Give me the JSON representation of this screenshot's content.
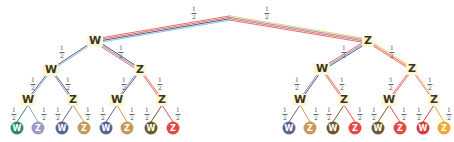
{
  "diagram": {
    "type": "probability-tree",
    "depth": 4,
    "colors": {
      "blue": "#8fc1e3",
      "navy": "#4a5a8c",
      "red": "#e8706a",
      "yellow": "#f2d27a",
      "slate": "#8a98b8",
      "node_bg": "#fdf7d8"
    },
    "nodes": [
      {
        "id": "n1",
        "label": "W",
        "x": 95,
        "y": 41
      },
      {
        "id": "n2",
        "label": "Z",
        "x": 368,
        "y": 41
      },
      {
        "id": "n11",
        "label": "W",
        "x": 51,
        "y": 70
      },
      {
        "id": "n12",
        "label": "Z",
        "x": 140,
        "y": 70
      },
      {
        "id": "n21",
        "label": "W",
        "x": 322,
        "y": 69
      },
      {
        "id": "n22",
        "label": "Z",
        "x": 412,
        "y": 69
      },
      {
        "id": "n111",
        "label": "W",
        "x": 28,
        "y": 100
      },
      {
        "id": "n112",
        "label": "Z",
        "x": 73,
        "y": 100
      },
      {
        "id": "n121",
        "label": "W",
        "x": 117,
        "y": 100
      },
      {
        "id": "n122",
        "label": "Z",
        "x": 162,
        "y": 100
      },
      {
        "id": "n211",
        "label": "W",
        "x": 300,
        "y": 100
      },
      {
        "id": "n212",
        "label": "Z",
        "x": 344,
        "y": 100
      },
      {
        "id": "n221",
        "label": "W",
        "x": 389,
        "y": 100
      },
      {
        "id": "n222",
        "label": "Z",
        "x": 434,
        "y": 100
      }
    ],
    "leaves": [
      {
        "label": "W",
        "x": 17,
        "color": "#2e8a76"
      },
      {
        "label": "Z",
        "x": 38,
        "color": "#9a9cc8"
      },
      {
        "label": "W",
        "x": 62,
        "color": "#5c6494"
      },
      {
        "label": "Z",
        "x": 84,
        "color": "#c89a5a"
      },
      {
        "label": "W",
        "x": 106,
        "color": "#5c6494"
      },
      {
        "label": "Z",
        "x": 127,
        "color": "#c89a5a"
      },
      {
        "label": "W",
        "x": 151,
        "color": "#6e5a2a"
      },
      {
        "label": "Z",
        "x": 173,
        "color": "#e24a46"
      },
      {
        "label": "W",
        "x": 289,
        "color": "#5c6494"
      },
      {
        "label": "Z",
        "x": 310,
        "color": "#c89a5a"
      },
      {
        "label": "W",
        "x": 333,
        "color": "#6e5a2a"
      },
      {
        "label": "Z",
        "x": 355,
        "color": "#e24a46"
      },
      {
        "label": "W",
        "x": 378,
        "color": "#6e5a2a"
      },
      {
        "label": "Z",
        "x": 400,
        "color": "#e24a46"
      },
      {
        "label": "W",
        "x": 423,
        "color": "#d83c3c"
      },
      {
        "label": "Z",
        "x": 444,
        "color": "#f0a830"
      }
    ],
    "leaf_y": 128,
    "root": {
      "x": 230,
      "y": 18
    },
    "edge_probability": {
      "num": "1",
      "den": "2"
    },
    "probabilities": [
      {
        "x": 194,
        "y": 13
      },
      {
        "x": 267,
        "y": 13
      },
      {
        "x": 62,
        "y": 52
      },
      {
        "x": 121,
        "y": 52
      },
      {
        "x": 344,
        "y": 52
      },
      {
        "x": 392,
        "y": 52
      },
      {
        "x": 33,
        "y": 84
      },
      {
        "x": 68,
        "y": 84
      },
      {
        "x": 124,
        "y": 84
      },
      {
        "x": 160,
        "y": 84
      },
      {
        "x": 297,
        "y": 84
      },
      {
        "x": 342,
        "y": 84
      },
      {
        "x": 391,
        "y": 84
      },
      {
        "x": 430,
        "y": 84
      },
      {
        "x": 14,
        "y": 114
      },
      {
        "x": 44,
        "y": 114
      },
      {
        "x": 58,
        "y": 114
      },
      {
        "x": 88,
        "y": 114
      },
      {
        "x": 103,
        "y": 114
      },
      {
        "x": 132,
        "y": 114
      },
      {
        "x": 147,
        "y": 114
      },
      {
        "x": 178,
        "y": 114
      },
      {
        "x": 285,
        "y": 114
      },
      {
        "x": 316,
        "y": 114
      },
      {
        "x": 329,
        "y": 114
      },
      {
        "x": 360,
        "y": 114
      },
      {
        "x": 374,
        "y": 114
      },
      {
        "x": 404,
        "y": 114
      },
      {
        "x": 419,
        "y": 114
      },
      {
        "x": 449,
        "y": 114
      }
    ]
  }
}
